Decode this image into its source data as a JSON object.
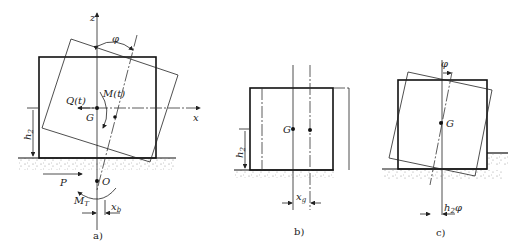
{
  "figure": {
    "panels": [
      {
        "id": "a",
        "caption": "a)",
        "labels": {
          "z_axis": "z",
          "x_axis": "x",
          "angle": "φ",
          "moment": "M(t)",
          "force_q": "Q(t)",
          "center": "G",
          "height": "h",
          "height_sub": "2",
          "push": "P",
          "pivot": "O",
          "moment_t": "M",
          "moment_t_sub": "T",
          "offset": "x",
          "offset_sub": "b"
        }
      },
      {
        "id": "b",
        "caption": "b)",
        "labels": {
          "center": "G",
          "height": "h",
          "height_sub": "2",
          "offset": "x",
          "offset_sub": "g"
        }
      },
      {
        "id": "c",
        "caption": "c)",
        "labels": {
          "angle": "φ",
          "center": "G",
          "offset": "h",
          "offset_sub": "2",
          "offset_suffix": "φ"
        }
      }
    ]
  }
}
